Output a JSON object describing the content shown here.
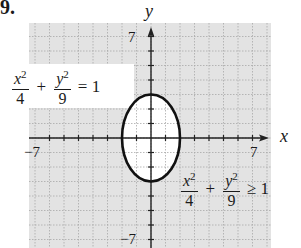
{
  "problem_number": "9.",
  "axes": {
    "x_label": "x",
    "y_label": "y",
    "x_min_label": "−7",
    "x_max_label": "7",
    "y_max_label": "7",
    "y_min_label": "−7"
  },
  "equations": {
    "boundary": {
      "num1": "x",
      "den1": "4",
      "num2": "y",
      "den2": "9",
      "exp": "2",
      "plus": "+",
      "relation": "= 1"
    },
    "inequality": {
      "num1": "x",
      "den1": "4",
      "num2": "y",
      "den2": "9",
      "exp": "2",
      "plus": "+",
      "relation": "≥ 1"
    }
  },
  "colors": {
    "shade": "#e3e3e3",
    "grid": "#a8a8a8",
    "curve": "#111111",
    "axis": "#222222"
  },
  "chart_data": {
    "type": "region",
    "title": "9.",
    "xlabel": "x",
    "ylabel": "y",
    "xlim": [
      -8.3,
      8.3
    ],
    "ylim": [
      -7.5,
      8
    ],
    "grid": true,
    "x_ticks": [
      -7,
      -6,
      -5,
      -4,
      -3,
      -2,
      -1,
      1,
      2,
      3,
      4,
      5,
      6,
      7
    ],
    "y_ticks": [
      -7,
      -6,
      -5,
      -4,
      -3,
      -2,
      -1,
      1,
      2,
      3,
      4,
      5,
      6,
      7
    ],
    "tick_labels": {
      "x": [
        "-7",
        "7"
      ],
      "y": [
        "7",
        "-7"
      ]
    },
    "curve": {
      "kind": "ellipse",
      "equation": "x^2/4 + y^2/9 = 1",
      "center": [
        0,
        0
      ],
      "semi_x": 2,
      "semi_y": 3,
      "style": "solid"
    },
    "shaded_region": "x^2/4 + y^2/9 >= 1 (outside ellipse)",
    "annotations": [
      "x^2/4 + y^2/9 = 1",
      "x^2/4 + y^2/9 >= 1"
    ]
  }
}
